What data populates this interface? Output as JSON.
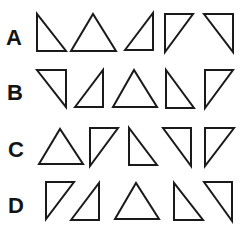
{
  "puzzle": {
    "rows": [
      {
        "label": "A",
        "triangles": [
          {
            "shape": "right-triangle",
            "right_angle": "bottom-left"
          },
          {
            "shape": "isosceles-triangle",
            "apex": "up"
          },
          {
            "shape": "right-triangle",
            "right_angle": "bottom-right"
          },
          {
            "shape": "right-triangle",
            "right_angle": "top-left"
          },
          {
            "shape": "right-triangle",
            "right_angle": "top-right"
          }
        ]
      },
      {
        "label": "B",
        "triangles": [
          {
            "shape": "right-triangle",
            "right_angle": "top-right"
          },
          {
            "shape": "right-triangle",
            "right_angle": "bottom-right"
          },
          {
            "shape": "isosceles-triangle",
            "apex": "up"
          },
          {
            "shape": "right-triangle",
            "right_angle": "bottom-left"
          },
          {
            "shape": "right-triangle",
            "right_angle": "top-left"
          }
        ]
      },
      {
        "label": "C",
        "triangles": [
          {
            "shape": "isosceles-triangle",
            "apex": "up"
          },
          {
            "shape": "right-triangle",
            "right_angle": "top-left"
          },
          {
            "shape": "right-triangle",
            "right_angle": "bottom-left"
          },
          {
            "shape": "right-triangle",
            "right_angle": "top-right"
          },
          {
            "shape": "right-triangle",
            "right_angle": "top-left"
          }
        ]
      },
      {
        "label": "D",
        "triangles": [
          {
            "shape": "right-triangle",
            "right_angle": "top-left"
          },
          {
            "shape": "right-triangle",
            "right_angle": "bottom-right"
          },
          {
            "shape": "isosceles-triangle",
            "apex": "up"
          },
          {
            "shape": "right-triangle",
            "right_angle": "bottom-left"
          },
          {
            "shape": "right-triangle",
            "right_angle": "top-right"
          }
        ]
      }
    ]
  }
}
